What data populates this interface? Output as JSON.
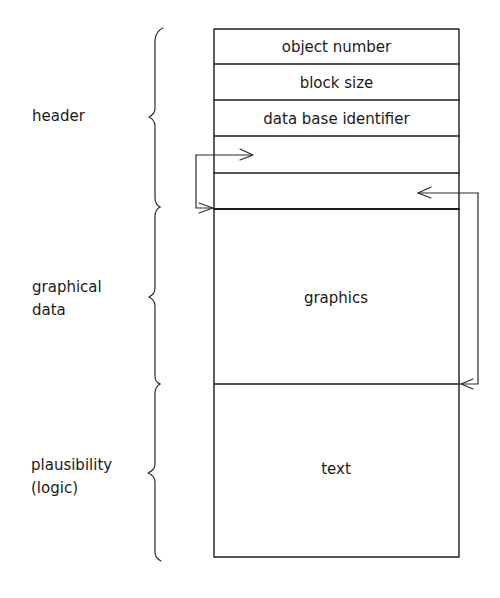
{
  "diagram": {
    "type": "data block structure",
    "block": {
      "x": 214,
      "width": 245,
      "header_rows": [
        {
          "label": "object number",
          "top": 29,
          "bottom": 64
        },
        {
          "label": "block size",
          "top": 64,
          "bottom": 100
        },
        {
          "label": "data base identifier",
          "top": 100,
          "bottom": 136
        },
        {
          "label": "",
          "top": 136,
          "bottom": 173
        },
        {
          "label": "",
          "top": 173,
          "bottom": 209
        }
      ],
      "sections": [
        {
          "label": "graphics",
          "top": 209,
          "bottom": 384
        },
        {
          "label": "text",
          "top": 384,
          "bottom": 557
        }
      ]
    },
    "groups": [
      {
        "label_lines": [
          "header"
        ],
        "brace_top": 28,
        "brace_mid": 117,
        "brace_bottom": 207
      },
      {
        "label_lines": [
          "graphical",
          "data"
        ],
        "brace_top": 207,
        "brace_mid": 297,
        "brace_bottom": 384
      },
      {
        "label_lines": [
          "plausibility",
          "(logic)"
        ],
        "brace_top": 384,
        "brace_mid": 473,
        "brace_bottom": 561
      }
    ],
    "pointers": [
      {
        "name": "pointer-to-graphics",
        "from_row": 4,
        "to_boundary": "graphics_start",
        "side": "left"
      },
      {
        "name": "pointer-to-text",
        "from_row": 5,
        "to_boundary": "text_start",
        "side": "right"
      }
    ],
    "colors": {
      "ink": "#1c1c1c",
      "paper": "#ffffff"
    }
  }
}
